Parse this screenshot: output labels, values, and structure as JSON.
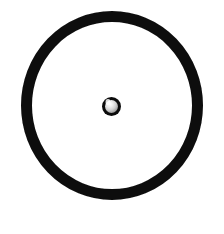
{
  "figure": {
    "background_color": "#ffffff",
    "canvas": {
      "width": 224,
      "height": 234
    },
    "caption": "",
    "elements": {
      "outer_ring": {
        "name": "outer-ring",
        "shape": "annulus",
        "center_x": 112,
        "center_y": 105.5,
        "outer_radius_x": 91,
        "outer_radius_y": 94.5,
        "stroke_width": 11,
        "stroke_color": "#0d0d0d",
        "fill_color": "none"
      },
      "center_bead": {
        "name": "center-bead",
        "shape": "sphere",
        "center_x": 111.5,
        "center_y": 106.5,
        "outer_radius": 9.5,
        "rim_width": 3,
        "rim_color": "#0b0b0b",
        "body_color": "#d9d9d9",
        "highlight_color": "#ffffff",
        "shadow_color": "#8f8f8f",
        "highlight_x": 108,
        "highlight_y": 102
      }
    }
  }
}
